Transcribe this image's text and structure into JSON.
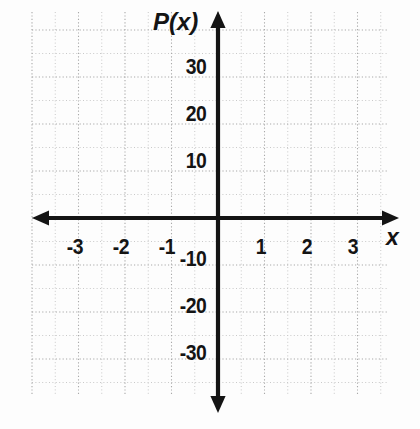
{
  "figure": {
    "kind": "coordinate-plane",
    "background_color": "#fdfdfd",
    "axis_color": "#141414",
    "grid_color": "#b9b9b9",
    "y_axis_name": "P(x)",
    "x_axis_name": "x"
  },
  "chart_data": {
    "type": "scatter",
    "title": "",
    "subtitle": "",
    "xlabel": "x",
    "ylabel": "P(x)",
    "xlim": [
      -3.95,
      3.85
    ],
    "ylim": [
      -40.5,
      41.5
    ],
    "grid": true,
    "legend": null,
    "series": [],
    "x": [],
    "values": [],
    "annotations": [],
    "x_tick_labels": [
      "-3",
      "-2",
      "-1",
      "1",
      "2",
      "3"
    ],
    "x_tick_values": [
      -3,
      -2,
      -1,
      1,
      2,
      3
    ],
    "y_tick_labels": [
      "30",
      "20",
      "10",
      "-10",
      "-20",
      "-30"
    ],
    "y_tick_values": [
      30,
      20,
      10,
      -10,
      -20,
      -30
    ],
    "x_major_step": 1,
    "y_major_step": 10,
    "x_minor_per_major": 2,
    "y_minor_per_major": 2
  },
  "x_ticks": [
    {
      "label": "-3",
      "value": -3,
      "px": 75,
      "py": 236
    },
    {
      "label": "-2",
      "value": -2,
      "px": 121,
      "py": 236
    },
    {
      "label": "-1",
      "value": -1,
      "px": 167,
      "py": 236
    },
    {
      "label": "1",
      "value": 1,
      "px": 261,
      "py": 236
    },
    {
      "label": "2",
      "value": 2,
      "px": 307,
      "py": 236
    },
    {
      "label": "3",
      "value": 3,
      "px": 353,
      "py": 236
    }
  ],
  "y_ticks": [
    {
      "label": "30",
      "value": 30,
      "px": 209,
      "py": 56
    },
    {
      "label": "20",
      "value": 20,
      "px": 209,
      "py": 103
    },
    {
      "label": "10",
      "value": 10,
      "px": 209,
      "py": 150
    },
    {
      "label": "-10",
      "value": -10,
      "px": 209,
      "py": 248
    },
    {
      "label": "-20",
      "value": -20,
      "px": 209,
      "py": 295
    },
    {
      "label": "-30",
      "value": -30,
      "px": 209,
      "py": 342
    }
  ],
  "geometry": {
    "origin_x": 218,
    "origin_y": 218,
    "x_axis_start": 32,
    "x_axis_end": 399,
    "y_axis_start": 11,
    "y_axis_end": 413,
    "major_step_x": 46.5,
    "major_step_y": 47.0,
    "minor_step_x": 23.25,
    "minor_step_y": 23.5,
    "grid_left": 32,
    "grid_right": 387,
    "grid_top": 12,
    "grid_bottom": 396
  }
}
